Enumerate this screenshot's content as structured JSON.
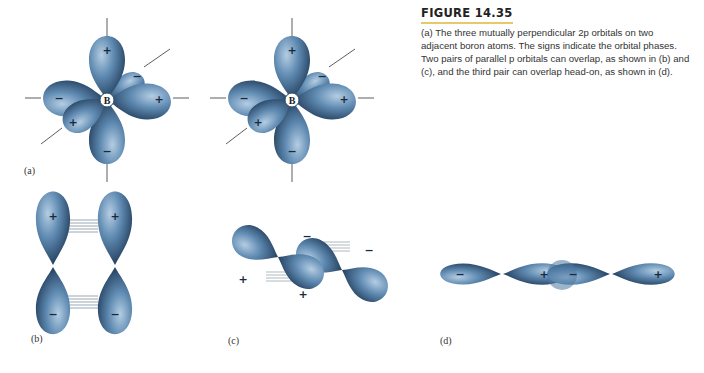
{
  "caption": {
    "title": "FIGURE 14.35",
    "body": "(a) The three mutually perpendicular 2p orbitals on two adjacent boron atoms. The signs indicate the orbital phases. Two pairs of parallel p orbitals can overlap, as shown in (b) and (c), and the third pair can overlap head-on, as shown in (d)."
  },
  "panels": {
    "a": {
      "label": "(a)",
      "atom": "B"
    },
    "b": {
      "label": "(b)"
    },
    "c": {
      "label": "(c)"
    },
    "d": {
      "label": "(d)"
    }
  },
  "colors": {
    "lobe": "#5b86ad",
    "lobe_dark": "#1f3c5c",
    "lobe_light": "#a9c6df",
    "accent_rule": "#e6c96a"
  }
}
